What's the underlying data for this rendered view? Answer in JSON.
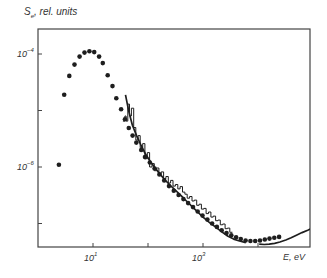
{
  "chart_data": {
    "type": "line",
    "title": "",
    "ylabel": "S_e, rel. units",
    "xlabel": "E, eV",
    "x_scale": "log",
    "y_scale": "log",
    "xlim": [
      1.3,
      100000
    ],
    "ylim": [
      1.2e-08,
      0.0003
    ],
    "x_ticks": [
      10,
      100,
      1000,
      10000
    ],
    "x_tick_labels": {
      "10": "10^1",
      "1000": "10^3"
    },
    "y_ticks": [
      0.0001,
      1e-05,
      1e-06,
      1e-07
    ],
    "y_tick_labels": {
      "0.0001": "10^-4",
      "1e-06": "10^-6"
    },
    "grid": false,
    "legend": null,
    "series": [
      {
        "name": "dots",
        "style": "markers",
        "x": [
          2.4,
          3.0,
          3.7,
          4.6,
          5.7,
          7.0,
          8.6,
          10.5,
          12.9,
          15.1,
          18.5,
          22.6,
          26.5,
          32.4,
          38.1,
          44.7,
          52.4,
          61.4,
          75.1,
          88.1,
          108,
          132,
          161,
          197,
          241,
          294,
          360,
          440,
          537,
          657,
          802,
          980,
          1200,
          1466,
          1790,
          2188,
          2673,
          3266,
          3990,
          4875,
          5956,
          7278,
          8892,
          10864,
          13274,
          16218,
          19815,
          24210
        ],
        "y": [
          1.1e-06,
          1.9e-05,
          4.1e-05,
          6.5e-05,
          9e-05,
          0.000106,
          0.000112,
          0.000108,
          9e-05,
          6.9e-05,
          4.2e-05,
          2.7e-05,
          1.65e-05,
          1.05e-05,
          7e-06,
          4.9e-06,
          3.6e-06,
          2.7e-06,
          2e-06,
          1.5e-06,
          1.2e-06,
          9.4e-07,
          7.4e-07,
          5.8e-07,
          4.6e-07,
          3.8e-07,
          3.2e-07,
          2.7e-07,
          2.3e-07,
          1.95e-07,
          1.63e-07,
          1.38e-07,
          1.17e-07,
          1e-07,
          8.7e-08,
          7.6e-08,
          6.8e-08,
          6.2e-08,
          5.7e-08,
          5.3e-08,
          5e-08,
          4.9e-08,
          4.9e-08,
          5e-08,
          5.2e-08,
          5.4e-08,
          5.6e-08,
          5.8e-08
        ]
      },
      {
        "name": "smooth curve",
        "style": "solid line",
        "x": [
          39,
          45,
          52,
          62,
          75,
          90,
          110,
          135,
          165,
          200,
          250,
          320,
          400,
          500,
          650,
          800,
          1000,
          1300,
          1700,
          2200,
          2800,
          3600,
          4600,
          6000
        ],
        "y": [
          1.9e-05,
          9.5e-06,
          5.5e-06,
          3.6e-06,
          2.4e-06,
          1.7e-06,
          1.25e-06,
          9.6e-07,
          7.5e-07,
          6e-07,
          4.8e-07,
          3.8e-07,
          3.1e-07,
          2.5e-07,
          1.95e-07,
          1.6e-07,
          1.3e-07,
          1.05e-07,
          8.6e-08,
          7.1e-08,
          6e-08,
          5.3e-08,
          4.9e-08,
          4.6e-08
        ]
      },
      {
        "name": "histogram",
        "style": "step line",
        "x": [
          35,
          38,
          40,
          43,
          46,
          50,
          55,
          60,
          66,
          72,
          80,
          88,
          97,
          107,
          118,
          130,
          143,
          158,
          174,
          192,
          212,
          234,
          258,
          285,
          315,
          348,
          384,
          424,
          468,
          517,
          571,
          630,
          696,
          768,
          848,
          936,
          1033,
          1140,
          1259,
          1390,
          1535,
          1695,
          1871,
          2066,
          2281,
          2518,
          2780,
          3070,
          3390
        ],
        "y": [
          6.5e-06,
          8e-06,
          6.5e-06,
          1.3e-05,
          8e-06,
          1.1e-05,
          5e-06,
          3e-06,
          3.6e-06,
          2.2e-06,
          2.6e-06,
          1.4e-06,
          1.8e-06,
          1e-06,
          1.15e-06,
          8.6e-07,
          9.6e-07,
          7.4e-07,
          8.2e-07,
          6.2e-07,
          6.8e-07,
          5.2e-07,
          5.8e-07,
          4.6e-07,
          4.9e-07,
          4.1e-07,
          4.5e-07,
          3.6e-07,
          3.3e-07,
          2.8e-07,
          3e-07,
          2.5e-07,
          2.6e-07,
          2.1e-07,
          2.2e-07,
          1.8e-07,
          1.85e-07,
          1.5e-07,
          1.6e-07,
          1.3e-07,
          1.35e-07,
          1.12e-07,
          1.15e-07,
          9.5e-08,
          9.8e-08,
          8.1e-08,
          8.3e-08,
          7e-08,
          7.1e-08
        ]
      },
      {
        "name": "high-energy curve",
        "style": "solid line",
        "x": [
          10500,
          13000,
          16000,
          20000,
          25000,
          32000,
          40000,
          50000,
          63000,
          80000,
          100000
        ],
        "y": [
          4.3e-08,
          4.25e-08,
          4.3e-08,
          4.45e-08,
          4.7e-08,
          5.1e-08,
          5.6e-08,
          6.2e-08,
          6.9e-08,
          7.6e-08,
          8.4e-08
        ]
      }
    ]
  },
  "labels": {
    "y_axis_symbol": "S",
    "y_axis_subscript": "e",
    "y_axis_rest": ", rel. units",
    "x_axis_title": "E, eV",
    "ytick_1e-4": "10",
    "ytick_1e-4_exp": "−4",
    "ytick_1e-6": "10",
    "ytick_1e-6_exp": "−6",
    "xtick_1e1": "10",
    "xtick_1e1_exp": "1",
    "xtick_1e3": "10",
    "xtick_1e3_exp": "3"
  },
  "style": {
    "ink": "#1e1e1e",
    "axis": "#444444"
  }
}
